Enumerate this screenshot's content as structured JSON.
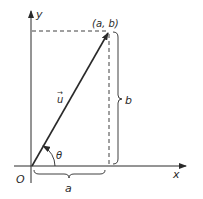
{
  "diagram": {
    "type": "vector-components",
    "axes": {
      "x_label": "x",
      "y_label": "y",
      "origin_label": "O"
    },
    "vector": {
      "label": "u",
      "arrow_accent": "→",
      "tip_label": "(a, b)"
    },
    "angle_label": "θ",
    "horizontal_component_label": "a",
    "vertical_component_label": "b",
    "colors": {
      "stroke": "#2a2a2a",
      "background": "#ffffff"
    }
  }
}
